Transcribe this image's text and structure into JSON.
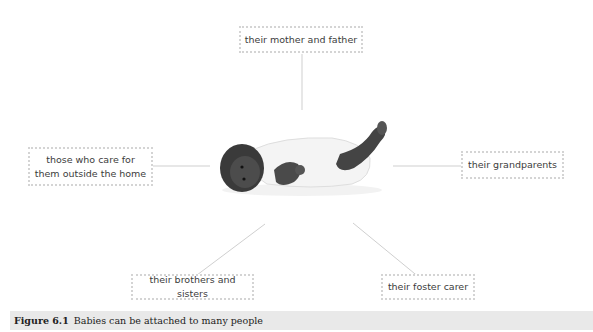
{
  "diagram": {
    "center": {
      "subject": "baby",
      "image_description": "infant lying on back in white vest, one leg raised"
    },
    "nodes": [
      {
        "id": "top",
        "label": "their mother and father"
      },
      {
        "id": "left",
        "label": "those who care for\nthem outside the home"
      },
      {
        "id": "right",
        "label": "their grandparents"
      },
      {
        "id": "bottom-left",
        "label": "their brothers and sisters"
      },
      {
        "id": "bottom-right",
        "label": "their foster carer"
      }
    ],
    "colors": {
      "box_border": "#d4d4d4",
      "connector": "#cfcfcf",
      "caption_bg": "#e9e9e9",
      "text": "#3c3c3c"
    }
  },
  "caption": {
    "figure_number": "Figure 6.1",
    "text": "Babies can be attached to many people"
  }
}
